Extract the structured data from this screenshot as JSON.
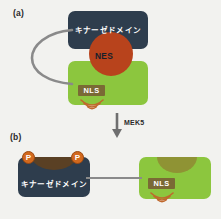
{
  "figure": {
    "panels": [
      {
        "id": "a",
        "label": "(a)",
        "kinase_domain_label": "キナーゼドメイン",
        "nes_label": "NES",
        "nls_label": "NLS",
        "nes_circle_color": "#b8431c",
        "kinase_box_color": "#2e3d4d",
        "cargo_box_color": "#8cc63e",
        "nls_tag_color": "#7a6a35",
        "tether_color": "#8a8a8a",
        "arc_icon": "radiating-arcs-icon"
      },
      {
        "id": "b",
        "label": "(b)",
        "kinase_domain_label": "キナーゼドメイン",
        "nls_label": "NLS",
        "phospho_label": "P",
        "phospho_color": "#d2691e",
        "kinase_box_color": "#2e3d4d",
        "cargo_box_color": "#8cc63e",
        "dome_color": "#8f8a32",
        "notch_color": "#5a4024",
        "nls_tag_color": "#7a6a35",
        "link_color": "#8a8a8a",
        "arc_icon": "radiating-arcs-icon"
      }
    ],
    "transition": {
      "arrow_label": "MEK5",
      "arrow_icon": "down-arrow-icon",
      "arrow_color": "#6f6f6f"
    }
  }
}
